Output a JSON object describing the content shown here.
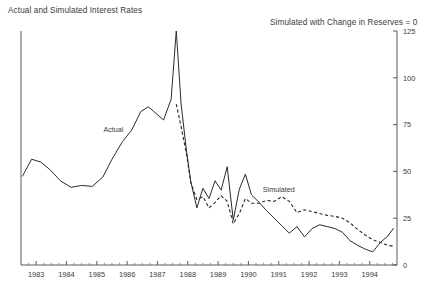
{
  "chart_title": "Actual and Simulated Interest Rates",
  "chart_subtitle": "Simulated with Change in Reserves = 0",
  "labels": {
    "actual": "Actual",
    "simulated": "Simulated"
  },
  "chart_data": {
    "type": "line",
    "title": "Actual and Simulated Interest Rates",
    "subtitle": "Simulated with Change in Reserves = 0",
    "xlabel": "",
    "ylabel": "",
    "xlim": [
      1982.5,
      1994.9
    ],
    "ylim": [
      0,
      125
    ],
    "yticks": [
      0,
      25,
      50,
      75,
      100,
      125
    ],
    "ytick_labels": [
      "0",
      "25",
      "50",
      "75",
      "100",
      "125"
    ],
    "y_axis_position": "right",
    "xticks": [
      1983,
      1984,
      1985,
      1986,
      1987,
      1988,
      1989,
      1990,
      1991,
      1992,
      1993,
      1994
    ],
    "xtick_labels": [
      "1983",
      "1984",
      "1985",
      "1986",
      "1987",
      "1988",
      "1989",
      "1990",
      "1991",
      "1992",
      "1993",
      "1994"
    ],
    "minor_xticks_per_interval": 4,
    "grid": false,
    "legend": "inline-annotations",
    "series": [
      {
        "name": "Actual",
        "style": "solid",
        "color": "#2a2a2a",
        "annotation": {
          "label": "Actual",
          "x": 1985.55,
          "y": 71
        },
        "x": [
          1982.55,
          1982.85,
          1983.15,
          1983.45,
          1983.8,
          1984.15,
          1984.5,
          1984.85,
          1985.2,
          1985.5,
          1985.85,
          1986.15,
          1986.45,
          1986.7,
          1986.95,
          1987.2,
          1987.45,
          1987.62,
          1987.78,
          1987.95,
          1988.1,
          1988.3,
          1988.5,
          1988.7,
          1988.9,
          1989.1,
          1989.3,
          1989.5,
          1989.7,
          1989.9,
          1990.1,
          1990.35,
          1990.6,
          1990.85,
          1991.1,
          1991.35,
          1991.6,
          1991.85,
          1992.1,
          1992.35,
          1992.6,
          1992.85,
          1993.1,
          1993.35,
          1993.6,
          1993.85,
          1994.1,
          1994.35,
          1994.6,
          1994.78
        ],
        "y": [
          47.5,
          56.5,
          55.0,
          51.0,
          45.0,
          41.5,
          42.5,
          42.0,
          47.0,
          56.5,
          66.0,
          72.0,
          82.0,
          84.5,
          81.0,
          77.5,
          88.5,
          125.0,
          86.0,
          62.0,
          44.5,
          30.5,
          41.0,
          35.5,
          45.0,
          40.0,
          52.5,
          24.0,
          40.5,
          48.5,
          37.5,
          33.5,
          29.0,
          25.0,
          21.0,
          17.0,
          20.5,
          15.0,
          19.5,
          21.5,
          20.5,
          19.5,
          17.5,
          13.0,
          10.5,
          8.5,
          7.0,
          12.0,
          15.5,
          19.5
        ]
      },
      {
        "name": "Simulated",
        "style": "dashed",
        "color": "#2a2a2a",
        "annotation": {
          "label": "Simulated",
          "x": 1991.0,
          "y": 39
        },
        "x": [
          1987.62,
          1987.78,
          1987.95,
          1988.1,
          1988.3,
          1988.5,
          1988.7,
          1988.9,
          1989.1,
          1989.3,
          1989.5,
          1989.7,
          1989.9,
          1990.1,
          1990.35,
          1990.6,
          1990.85,
          1991.1,
          1991.35,
          1991.6,
          1991.85,
          1992.1,
          1992.35,
          1992.6,
          1992.85,
          1993.1,
          1993.35,
          1993.6,
          1993.85,
          1994.1,
          1994.35,
          1994.6,
          1994.78
        ],
        "y": [
          86.0,
          74.0,
          60.0,
          44.0,
          35.0,
          36.5,
          30.5,
          33.5,
          37.0,
          34.0,
          22.0,
          27.5,
          35.5,
          33.0,
          33.0,
          34.5,
          34.0,
          36.5,
          34.0,
          28.0,
          29.5,
          28.5,
          27.5,
          26.5,
          26.0,
          25.0,
          22.5,
          19.0,
          16.0,
          13.5,
          12.0,
          10.5,
          10.0
        ]
      }
    ]
  }
}
